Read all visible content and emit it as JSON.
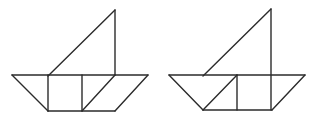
{
  "canvas": {
    "width": 319,
    "height": 118,
    "background_color": "#ffffff",
    "stroke_color": "#2b2b2b",
    "stroke_width": 1.4
  },
  "figures": [
    {
      "name": "tangram-boat-left",
      "description": "sailboat tangram figure, mast ends at hull top, square centered in hull with diagonal splitting right section",
      "segments": [
        {
          "name": "hull-top-edge",
          "x1": 12,
          "y1": 75,
          "x2": 148,
          "y2": 75
        },
        {
          "name": "hull-left-slant",
          "x1": 12,
          "y1": 75,
          "x2": 48,
          "y2": 111
        },
        {
          "name": "hull-bottom-edge",
          "x1": 48,
          "y1": 111,
          "x2": 115,
          "y2": 111
        },
        {
          "name": "hull-right-slant",
          "x1": 148,
          "y1": 75,
          "x2": 115,
          "y2": 111
        },
        {
          "name": "square-left-edge",
          "x1": 48,
          "y1": 75,
          "x2": 48,
          "y2": 111
        },
        {
          "name": "square-right-edge",
          "x1": 82,
          "y1": 75,
          "x2": 82,
          "y2": 111
        },
        {
          "name": "hull-inner-diagonal",
          "x1": 82,
          "y1": 111,
          "x2": 115,
          "y2": 75
        },
        {
          "name": "sail-mast-edge",
          "x1": 115,
          "y1": 10,
          "x2": 115,
          "y2": 75
        },
        {
          "name": "sail-hypotenuse",
          "x1": 115,
          "y1": 10,
          "x2": 48,
          "y2": 76
        }
      ]
    },
    {
      "name": "tangram-boat-right",
      "description": "sailboat tangram figure, mast passes through hull to bottom, triangle on left of hull and square on right",
      "segments": [
        {
          "name": "hull-top-edge",
          "x1": 169,
          "y1": 75,
          "x2": 305,
          "y2": 75
        },
        {
          "name": "hull-left-slant",
          "x1": 169,
          "y1": 75,
          "x2": 203,
          "y2": 110
        },
        {
          "name": "hull-bottom-edge",
          "x1": 203,
          "y1": 110,
          "x2": 272,
          "y2": 110
        },
        {
          "name": "hull-right-slant",
          "x1": 305,
          "y1": 75,
          "x2": 272,
          "y2": 110
        },
        {
          "name": "hull-inner-diagonal",
          "x1": 237,
          "y1": 75,
          "x2": 203,
          "y2": 110
        },
        {
          "name": "square-left-edge",
          "x1": 237,
          "y1": 75,
          "x2": 237,
          "y2": 110
        },
        {
          "name": "sail-mast-edge",
          "x1": 271,
          "y1": 9,
          "x2": 271,
          "y2": 110
        },
        {
          "name": "sail-hypotenuse",
          "x1": 271,
          "y1": 9,
          "x2": 203,
          "y2": 76
        }
      ]
    }
  ]
}
